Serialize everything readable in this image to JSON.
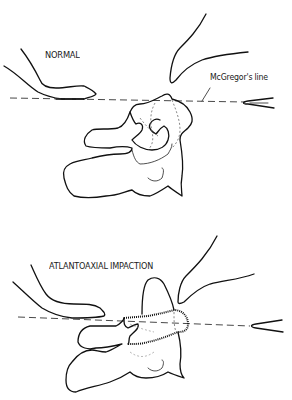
{
  "figure": {
    "panels": [
      {
        "id": "normal",
        "title": "NORMAL"
      },
      {
        "id": "atlantoaxial-impaction",
        "title": "ATLANTOAXIAL IMPACTION"
      }
    ],
    "annotations": {
      "reference_line": "McGregor's line"
    }
  }
}
